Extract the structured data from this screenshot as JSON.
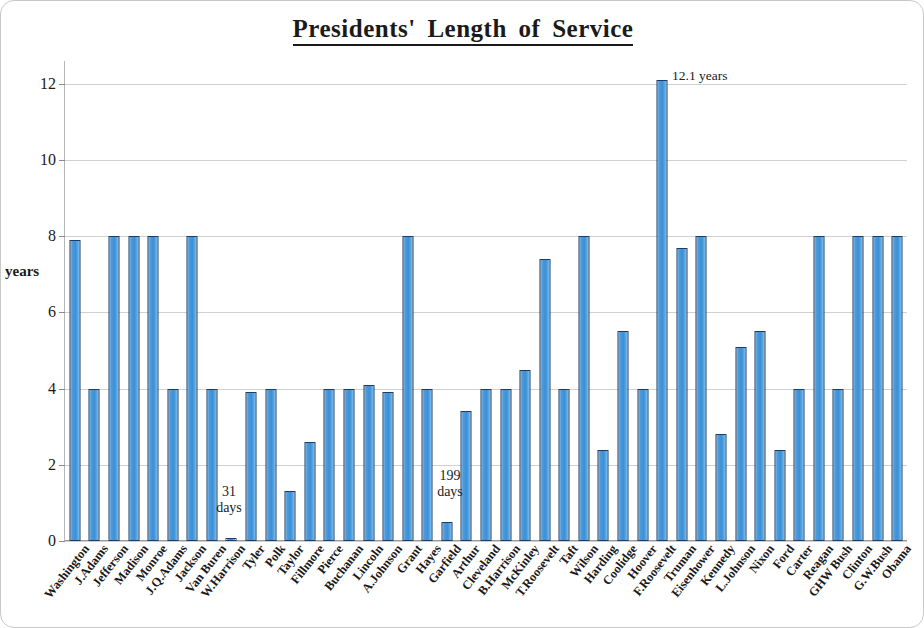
{
  "chart_data": {
    "type": "bar",
    "title": "Presidents' Length of Service",
    "xlabel": "",
    "ylabel": "years",
    "ylim": [
      0,
      12.6
    ],
    "grid": true,
    "legend": "none",
    "y_ticks": [
      0,
      2,
      4,
      6,
      8,
      10,
      12
    ],
    "y_tick_labels": [
      "0",
      "2",
      "4",
      "6",
      "8",
      "10",
      "12"
    ],
    "categories": [
      "Washington",
      "J.Adams",
      "Jefferson",
      "Madison",
      "Monroe",
      "J.Q.Adams",
      "Jackson",
      "Van Buren",
      "W.Harrison",
      "Tyler",
      "Polk",
      "Taylor",
      "Fillmore",
      "Pierce",
      "Buchanan",
      "Lincoln",
      "A.Johnson",
      "Grant",
      "Hayes",
      "Garfield",
      "Arthur",
      "Cleveland",
      "B.Harrison",
      "McKinley",
      "T.Roosevelt",
      "Taft",
      "Wilson",
      "Harding",
      "Coolidge",
      "Hoover",
      "F.Roosevelt",
      "Truman",
      "Eisenhower",
      "Kennedy",
      "L.Johnson",
      "Nixon",
      "Ford",
      "Carter",
      "Reagan",
      "GHW Bush",
      "Clinton",
      "G.W.Bush",
      "Obama"
    ],
    "values": [
      7.9,
      4.0,
      8.0,
      8.0,
      8.0,
      4.0,
      8.0,
      4.0,
      0.08,
      3.9,
      4.0,
      1.3,
      2.6,
      4.0,
      4.0,
      4.1,
      3.9,
      8.0,
      4.0,
      0.5,
      3.4,
      4.0,
      4.0,
      4.5,
      7.4,
      4.0,
      8.0,
      2.4,
      5.5,
      4.0,
      12.1,
      7.7,
      8.0,
      2.8,
      5.1,
      5.5,
      2.4,
      4.0,
      8.0,
      4.0,
      8.0,
      8.0,
      8.0
    ],
    "annotations": [
      {
        "id": "harrison",
        "text": "31\ndays",
        "for": "W.Harrison"
      },
      {
        "id": "garfield",
        "text": "199\ndays",
        "for": "Garfield"
      },
      {
        "id": "fdr",
        "text": "12.1 years",
        "for": "F.Roosevelt"
      }
    ],
    "colors": {
      "bar_fill": "#4a9ade",
      "bar_edge": "#1f3b63",
      "gridline": "#d0d0d0",
      "axis": "#9a9a9a",
      "text": "#1a1a1a",
      "background": "#ffffff"
    }
  }
}
